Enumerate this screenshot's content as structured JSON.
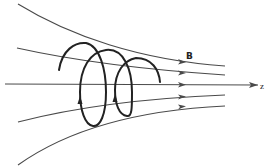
{
  "diagram": {
    "labels": {
      "field": "B",
      "axis": "z"
    },
    "field_lines": [
      {
        "name": "field-line-top",
        "path": "M18,4 C70,36 140,60 225,66"
      },
      {
        "name": "field-line-upper",
        "path": "M17,48 C80,62 150,70 225,75"
      },
      {
        "name": "axis-z",
        "path": "M5,84 L258,85"
      },
      {
        "name": "field-line-lower",
        "path": "M18,122 C80,106 150,98 225,95"
      },
      {
        "name": "field-line-bottom",
        "path": "M18,165 C70,128 140,110 225,106"
      }
    ],
    "helix_path": "M59,70 C62,50 75,42 86,43 C100,46 106,70 106,92 C106,115 100,127 93,126 C85,125 80,110 80,92 C80,68 90,52 106,50 C124,48 132,70 132,92 C132,108 132,117 127,116 C119,115 115,104 115,90 C115,72 124,60 136,58 C152,58 159,70 160,82",
    "colors": {
      "lines": "#4a4a4a",
      "helix": "#222222",
      "background": "#ffffff"
    }
  }
}
